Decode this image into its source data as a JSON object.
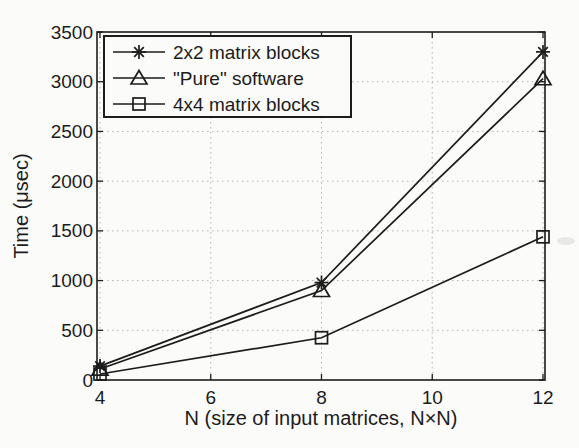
{
  "figure": {
    "background": "#fbfbf9",
    "ink": "#1c1c1c",
    "grid_color": "#b5b5b5",
    "legend_fill": "#fbfbf9"
  },
  "chart_data": {
    "type": "line",
    "title": "",
    "xlabel": "N (size of input matrices, N×N)",
    "ylabel": "Time (μsec)",
    "x": [
      4,
      8,
      12
    ],
    "series": [
      {
        "name": "2x2 matrix blocks",
        "marker": "asterisk",
        "values": [
          140,
          980,
          3300
        ]
      },
      {
        "name": "\"Pure\" software",
        "marker": "triangle",
        "values": [
          110,
          900,
          3030
        ]
      },
      {
        "name": "4x4 matrix blocks",
        "marker": "square",
        "values": [
          60,
          425,
          1440
        ]
      }
    ],
    "xlim": [
      4,
      12
    ],
    "ylim": [
      0,
      3500
    ],
    "xticks": [
      4,
      6,
      8,
      10,
      12
    ],
    "yticks": [
      0,
      500,
      1000,
      1500,
      2000,
      2500,
      3000,
      3500
    ],
    "grid": "dotted",
    "legend_position": "top-left"
  }
}
